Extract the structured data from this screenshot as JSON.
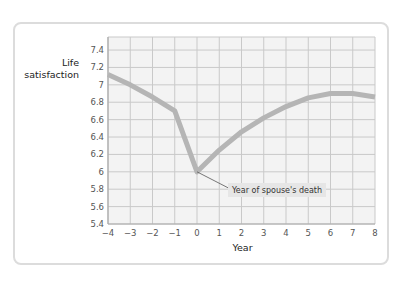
{
  "chart_data": {
    "type": "line",
    "title": "",
    "xlabel": "Year",
    "ylabel": "Life satisfaction",
    "ylabel_lines": [
      "Life",
      "satisfaction"
    ],
    "x": [
      -4,
      -3,
      -2,
      -1,
      0,
      1,
      2,
      3,
      4,
      5,
      6,
      7,
      8
    ],
    "series": [
      {
        "name": "Life satisfaction",
        "values": [
          7.12,
          7.0,
          6.86,
          6.7,
          6.0,
          6.25,
          6.46,
          6.62,
          6.75,
          6.85,
          6.9,
          6.9,
          6.86
        ],
        "color": "#b5b5b5"
      }
    ],
    "x_ticks": [
      "−4",
      "−3",
      "−2",
      "−1",
      "0",
      "1",
      "2",
      "3",
      "4",
      "5",
      "6",
      "7",
      "8"
    ],
    "y_ticks": [
      "5.4",
      "5.6",
      "5.8",
      "6",
      "6.2",
      "6.4",
      "6.6",
      "6.8",
      "7",
      "7.2",
      "7.4"
    ],
    "xlim": [
      -4,
      8
    ],
    "ylim": [
      5.4,
      7.55
    ],
    "grid": true,
    "legend": null,
    "annotations": [
      {
        "text": "Year of spouse's death",
        "x": 0,
        "y": 6.0
      }
    ]
  },
  "colors": {
    "plot_background": "#f3f3f3",
    "grid": "#c9c9c9",
    "line": "#b5b5b5",
    "card_border": "#dcdcdc",
    "annotation_box": "#e6e6e6"
  }
}
